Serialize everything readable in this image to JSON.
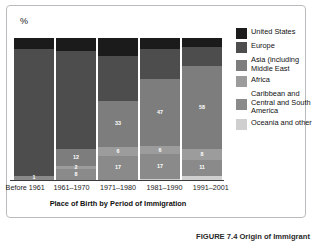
{
  "figure": {
    "y_axis_label": "%",
    "axis_title": "Place of Birth by Period of Immigration",
    "caption": "FIGURE 7.4 Origin of Immigrant"
  },
  "legend": {
    "items": [
      {
        "label": "United States",
        "color": "#1b1b1b"
      },
      {
        "label": "Europe",
        "color": "#4d4d4d"
      },
      {
        "label": "Asia (including Middle East",
        "color": "#7d7d7d"
      },
      {
        "label": "Africa",
        "color": "#9c9c9c"
      },
      {
        "label": "Caribbean and Central and South America",
        "color": "#8a8a8a"
      },
      {
        "label": "Oceania and other",
        "color": "#cfcfcf"
      }
    ]
  },
  "chart_data": {
    "type": "bar",
    "subtype": "stacked-bar",
    "title": "",
    "xlabel": "Place of Birth by Period of Immigration",
    "ylabel": "%",
    "ylim": [
      0,
      100
    ],
    "grid": false,
    "legend_position": "right",
    "categories": [
      "Before 1961",
      "1961–1970",
      "1971–1980",
      "1981–1990",
      "1991–2001"
    ],
    "series": [
      {
        "name": "United States",
        "color": "#1b1b1b",
        "values": [
          8,
          9,
          13,
          8,
          6
        ],
        "labels": [
          "",
          "",
          "",
          "",
          ""
        ]
      },
      {
        "name": "Europe",
        "color": "#4d4d4d",
        "values": [
          89,
          69,
          31,
          21,
          14
        ],
        "labels": [
          "",
          "",
          "",
          "",
          ""
        ]
      },
      {
        "name": "Asia (including Middle East",
        "color": "#7d7d7d",
        "values": [
          0,
          12,
          33,
          47,
          58
        ],
        "labels": [
          "",
          "12",
          "33",
          "47",
          "58"
        ]
      },
      {
        "name": "Africa",
        "color": "#9c9c9c",
        "values": [
          0,
          2,
          6,
          6,
          8
        ],
        "labels": [
          "",
          "2",
          "6",
          "6",
          "8"
        ]
      },
      {
        "name": "Caribbean and Central and South America",
        "color": "#8a8a8a",
        "values": [
          3,
          8,
          17,
          17,
          11
        ],
        "labels": [
          "1",
          "8",
          "17",
          "17",
          "11"
        ]
      },
      {
        "name": "Oceania and other",
        "color": "#cfcfcf",
        "values": [
          0,
          0,
          0,
          1,
          3
        ],
        "labels": [
          "",
          "",
          "",
          "",
          ""
        ]
      }
    ]
  },
  "bars": [
    {
      "category": "Before 1961",
      "segments": [
        {
          "series": "United States",
          "value": 8,
          "label": "",
          "color": "#1b1b1b"
        },
        {
          "series": "Europe",
          "value": 89,
          "label": "",
          "color": "#4d4d4d"
        },
        {
          "series": "Caribbean and Central and South America",
          "value": 3,
          "label": "1",
          "color": "#8a8a8a"
        }
      ]
    },
    {
      "category": "1961–1970",
      "segments": [
        {
          "series": "United States",
          "value": 9,
          "label": "",
          "color": "#1b1b1b"
        },
        {
          "series": "Europe",
          "value": 69,
          "label": "",
          "color": "#4d4d4d"
        },
        {
          "series": "Asia (including Middle East",
          "value": 12,
          "label": "12",
          "color": "#7d7d7d"
        },
        {
          "series": "Africa",
          "value": 2,
          "label": "2",
          "color": "#9c9c9c"
        },
        {
          "series": "Caribbean and Central and South America",
          "value": 8,
          "label": "8",
          "color": "#8a8a8a"
        }
      ]
    },
    {
      "category": "1971–1980",
      "segments": [
        {
          "series": "United States",
          "value": 13,
          "label": "",
          "color": "#1b1b1b"
        },
        {
          "series": "Europe",
          "value": 31,
          "label": "",
          "color": "#4d4d4d"
        },
        {
          "series": "Asia (including Middle East",
          "value": 33,
          "label": "33",
          "color": "#7d7d7d"
        },
        {
          "series": "Africa",
          "value": 6,
          "label": "6",
          "color": "#9c9c9c"
        },
        {
          "series": "Caribbean and Central and South America",
          "value": 17,
          "label": "17",
          "color": "#8a8a8a"
        }
      ]
    },
    {
      "category": "1981–1990",
      "segments": [
        {
          "series": "United States",
          "value": 8,
          "label": "",
          "color": "#1b1b1b"
        },
        {
          "series": "Europe",
          "value": 21,
          "label": "",
          "color": "#4d4d4d"
        },
        {
          "series": "Asia (including Middle East",
          "value": 47,
          "label": "47",
          "color": "#7d7d7d"
        },
        {
          "series": "Africa",
          "value": 6,
          "label": "6",
          "color": "#9c9c9c"
        },
        {
          "series": "Caribbean and Central and South America",
          "value": 17,
          "label": "17",
          "color": "#8a8a8a"
        },
        {
          "series": "Oceania and other",
          "value": 1,
          "label": "",
          "color": "#cfcfcf"
        }
      ]
    },
    {
      "category": "1991–2001",
      "segments": [
        {
          "series": "United States",
          "value": 6,
          "label": "",
          "color": "#1b1b1b"
        },
        {
          "series": "Europe",
          "value": 14,
          "label": "",
          "color": "#4d4d4d"
        },
        {
          "series": "Asia (including Middle East",
          "value": 58,
          "label": "58",
          "color": "#7d7d7d"
        },
        {
          "series": "Africa",
          "value": 8,
          "label": "8",
          "color": "#9c9c9c"
        },
        {
          "series": "Caribbean and Central and South America",
          "value": 11,
          "label": "11",
          "color": "#8a8a8a"
        },
        {
          "series": "Oceania and other",
          "value": 3,
          "label": "",
          "color": "#cfcfcf"
        }
      ]
    }
  ]
}
